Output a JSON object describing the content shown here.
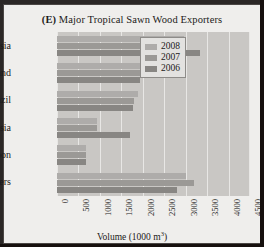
{
  "figure": {
    "panel_id": "(E)",
    "title_text": "Major Tropical Sawn Wood Exporters"
  },
  "legend": {
    "position": "top-right-inside",
    "items": [
      {
        "label": "2008",
        "color": "#aeacaa"
      },
      {
        "label": "2007",
        "color": "#9b9996"
      },
      {
        "label": "2006",
        "color": "#888683"
      }
    ]
  },
  "axis": {
    "x_title_main": "Volume (1000 m",
    "x_title_sup": "3",
    "x_title_close": ")",
    "ticks": [
      "0",
      "500",
      "1000",
      "1500",
      "2000",
      "2500",
      "3000",
      "3500",
      "4000",
      "4500"
    ]
  },
  "chart_data": {
    "type": "bar",
    "orientation": "horizontal",
    "title": "(E) Major Tropical Sawn Wood Exporters",
    "xlabel": "Volume (1000 m3)",
    "ylabel": "",
    "xlim": [
      0,
      4500
    ],
    "xticks": [
      0,
      500,
      1000,
      1500,
      2000,
      2500,
      3000,
      3500,
      4000,
      4500
    ],
    "grid": true,
    "legend_position": "upper right",
    "categories": [
      "Malaysia",
      "Thailand",
      "Brazil",
      "Indonesia",
      "Cameroon",
      "Others"
    ],
    "series": [
      {
        "name": "2008",
        "color": "#aeacaa",
        "values": [
          2970,
          2730,
          1890,
          930,
          680,
          3010
        ]
      },
      {
        "name": "2007",
        "color": "#9b9996",
        "values": [
          2970,
          2730,
          1800,
          930,
          680,
          3200
        ]
      },
      {
        "name": "2006",
        "color": "#888683",
        "values": [
          3340,
          1940,
          1780,
          1700,
          680,
          2800
        ]
      }
    ]
  }
}
